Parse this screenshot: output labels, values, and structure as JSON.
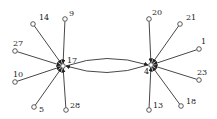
{
  "diagram": {
    "type": "directed-graph",
    "colors": {
      "edge": "#333333",
      "node_stroke": "#333333",
      "node_fill": "#ffffff",
      "label": "#222222"
    },
    "hubs": [
      {
        "id": "17",
        "label": "17",
        "x": 63,
        "y": 66,
        "label_dx": 4,
        "label_dy": -3
      },
      {
        "id": "4",
        "label": "4",
        "x": 151,
        "y": 65,
        "label_dx": -7,
        "label_dy": 9
      }
    ],
    "leaves": [
      {
        "id": "14",
        "label": "14",
        "x": 33,
        "y": 24,
        "target": "17",
        "label_dx": 6,
        "label_dy": -4
      },
      {
        "id": "9",
        "label": "9",
        "x": 65,
        "y": 19,
        "target": "17",
        "label_dx": 4,
        "label_dy": -3
      },
      {
        "id": "27",
        "label": "27",
        "x": 15,
        "y": 51,
        "target": "17",
        "label_dx": -2,
        "label_dy": -5
      },
      {
        "id": "10",
        "label": "10",
        "x": 15,
        "y": 82,
        "target": "17",
        "label_dx": -2,
        "label_dy": -5
      },
      {
        "id": "5",
        "label": "5",
        "x": 34,
        "y": 107,
        "target": "17",
        "label_dx": 5,
        "label_dy": 5
      },
      {
        "id": "28",
        "label": "28",
        "x": 66,
        "y": 110,
        "target": "17",
        "label_dx": 4,
        "label_dy": -2
      },
      {
        "id": "20",
        "label": "20",
        "x": 149,
        "y": 19,
        "target": "4",
        "label_dx": 3,
        "label_dy": -4
      },
      {
        "id": "21",
        "label": "21",
        "x": 180,
        "y": 24,
        "target": "4",
        "label_dx": 6,
        "label_dy": -4
      },
      {
        "id": "1",
        "label": "1",
        "x": 199,
        "y": 49,
        "target": "4",
        "label_dx": 2,
        "label_dy": -5
      },
      {
        "id": "23",
        "label": "23",
        "x": 199,
        "y": 80,
        "target": "4",
        "label_dx": -2,
        "label_dy": -5
      },
      {
        "id": "18",
        "label": "18",
        "x": 181,
        "y": 106,
        "target": "4",
        "label_dx": 5,
        "label_dy": -2
      },
      {
        "id": "13",
        "label": "13",
        "x": 149,
        "y": 110,
        "target": "4",
        "label_dx": 4,
        "label_dy": -2
      }
    ],
    "hub_edges": [
      {
        "from": "17",
        "to": "4",
        "curve": "upper"
      },
      {
        "from": "4",
        "to": "17",
        "curve": "lower"
      }
    ]
  }
}
